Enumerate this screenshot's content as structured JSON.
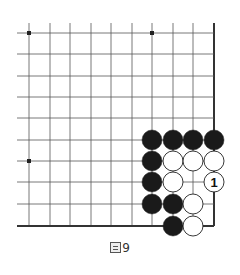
{
  "diagram": {
    "type": "go-board-corner",
    "grid": {
      "x_lines": [
        29,
        50,
        70,
        91,
        111,
        132,
        152,
        173,
        193,
        214
      ],
      "y_lines": [
        33,
        54,
        76,
        97,
        118,
        140,
        161,
        182,
        204,
        226
      ],
      "line_color": "#555555",
      "edge_color": "#333333",
      "right_edge_x": 214,
      "bottom_edge_y": 226
    },
    "star_points": [
      {
        "x": 29,
        "y": 33
      },
      {
        "x": 152,
        "y": 33
      },
      {
        "x": 29,
        "y": 161
      }
    ],
    "stones": [
      {
        "color": "black",
        "x": 152,
        "y": 140
      },
      {
        "color": "black",
        "x": 173,
        "y": 140
      },
      {
        "color": "black",
        "x": 193,
        "y": 140
      },
      {
        "color": "black",
        "x": 214,
        "y": 140
      },
      {
        "color": "black",
        "x": 152,
        "y": 161
      },
      {
        "color": "white",
        "x": 173,
        "y": 161
      },
      {
        "color": "white",
        "x": 193,
        "y": 161
      },
      {
        "color": "white",
        "x": 214,
        "y": 161
      },
      {
        "color": "black",
        "x": 152,
        "y": 182
      },
      {
        "color": "white",
        "x": 173,
        "y": 182
      },
      {
        "color": "white",
        "x": 214,
        "y": 182,
        "label": "1"
      },
      {
        "color": "black",
        "x": 152,
        "y": 204
      },
      {
        "color": "black",
        "x": 173,
        "y": 204
      },
      {
        "color": "white",
        "x": 193,
        "y": 204
      },
      {
        "color": "black",
        "x": 173,
        "y": 226
      },
      {
        "color": "white",
        "x": 193,
        "y": 226
      }
    ]
  },
  "caption": {
    "prefix_char": "圖",
    "number": "9"
  }
}
